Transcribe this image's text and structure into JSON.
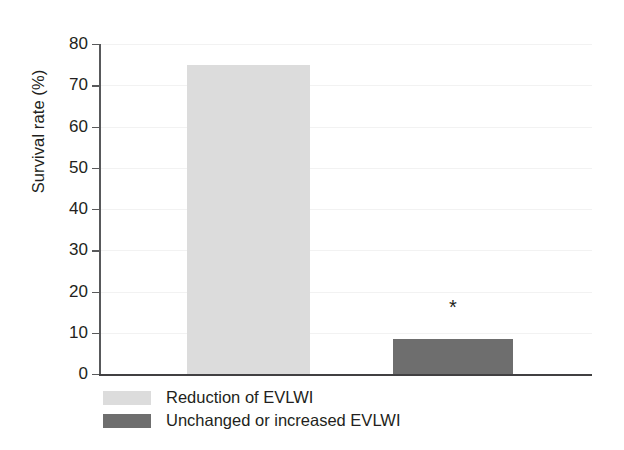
{
  "chart_data": {
    "type": "bar",
    "title": "",
    "xlabel": "",
    "ylabel": "Survival rate (%)",
    "categories": [
      "Reduction of EVLWI",
      "Unchanged or increased EVLWI"
    ],
    "values": [
      75,
      8.5
    ],
    "ylim": [
      0,
      80
    ],
    "ytick_step": 10,
    "yticks": [
      "80",
      "70",
      "60",
      "50",
      "40",
      "30",
      "20",
      "10",
      "0"
    ],
    "ytick_values": [
      80,
      70,
      60,
      50,
      40,
      30,
      20,
      10,
      0
    ],
    "grid": "horizontal",
    "legend_position": "below-axis-left",
    "annotations": [
      {
        "text": "*",
        "series": "Unchanged or increased EVLWI",
        "meaning": "statistically-significant"
      }
    ],
    "series": [
      {
        "name": "Reduction of EVLWI",
        "value": 75,
        "color": "#dcdcdc"
      },
      {
        "name": "Unchanged or increased EVLWI",
        "value": 8.5,
        "color": "#6e6e6e"
      }
    ]
  },
  "legend": {
    "items": [
      {
        "label": "Reduction of EVLWI",
        "color": "#dcdcdc"
      },
      {
        "label": "Unchanged or increased EVLWI",
        "color": "#6e6e6e"
      }
    ]
  },
  "axis": {
    "y_title": "Survival rate (%)",
    "tick_labels": [
      "80",
      "70",
      "60",
      "50",
      "40",
      "30",
      "20",
      "10",
      "0"
    ]
  },
  "annotation": {
    "asterisk": "*"
  },
  "colors": {
    "bar_light": "#dcdcdc",
    "bar_dark": "#6e6e6e",
    "axis": "#414042",
    "grid": "#f2f2f2",
    "text": "#231f20",
    "background": "#ffffff"
  }
}
